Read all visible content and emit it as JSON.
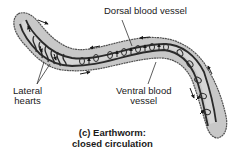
{
  "diagram": {
    "labels": {
      "dorsal": "Dorsal blood vessel",
      "lateral_line1": "Lateral",
      "lateral_line2": "hearts",
      "ventral_line1": "Ventral blood",
      "ventral_line2": "vessel"
    },
    "caption": {
      "line1": "(c) Earthworm:",
      "line2": "closed circulation"
    },
    "colors": {
      "body_fill": "#c8c8c8",
      "body_stroke": "#505050",
      "vessel": "#2a2a2a",
      "inner_fill": "#d6d6d6",
      "text": "#1a1a1a",
      "background": "#ffffff"
    }
  }
}
